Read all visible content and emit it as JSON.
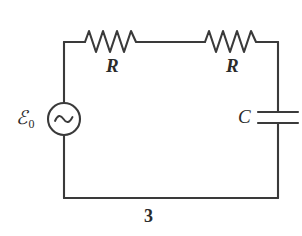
{
  "figure": {
    "number": "3",
    "type": "schematic-circuit-diagram",
    "background_color": "#ffffff",
    "stroke_color": "#3a3a3a",
    "text_color": "#2b2b2b"
  },
  "labels": {
    "resistor_1": "R",
    "resistor_2": "R",
    "capacitor": "C",
    "emf_symbol": "ℰ",
    "emf_subscript": "0"
  },
  "components": [
    {
      "name": "ac-voltage-source",
      "symbol": "circle-with-sine-wave",
      "label": "ℰ",
      "subscript": "0",
      "position": "left-branch",
      "center_x": 64,
      "center_y": 119,
      "radius": 16
    },
    {
      "name": "resistor-1",
      "symbol": "zigzag",
      "label": "R",
      "position": "top-branch-left",
      "x_start": 85,
      "x_end": 140,
      "baseline_y": 42,
      "peaks": 4
    },
    {
      "name": "resistor-2",
      "symbol": "zigzag",
      "label": "R",
      "position": "top-branch-right",
      "x_start": 205,
      "x_end": 260,
      "baseline_y": 42,
      "peaks": 4
    },
    {
      "name": "capacitor",
      "symbol": "parallel-plates",
      "label": "C",
      "position": "right-branch",
      "plate_x_start": 258,
      "plate_x_end": 298,
      "plate_top_y": 112,
      "plate_bottom_y": 123
    }
  ],
  "loop": {
    "left_x": 64,
    "right_x": 278,
    "top_y": 42,
    "bottom_y": 198
  },
  "caption": {
    "figure_number": "3"
  }
}
